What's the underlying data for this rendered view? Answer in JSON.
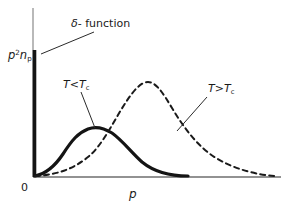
{
  "figure": {
    "type": "physics-distribution-diagram",
    "background": "#ffffff",
    "ink_color": "#1a1a1a",
    "width": 282,
    "height": 209
  },
  "axes": {
    "origin_label": "0",
    "x_label": "p",
    "y_label_base": "p",
    "y_label_exponent": "2",
    "y_label_second": "n",
    "y_label_subscript": "p",
    "y_label_text": "p²nₚ",
    "x_axis": {
      "x1": 33,
      "y1": 177,
      "x2": 281,
      "y2": 177
    },
    "y_axis": {
      "x1": 33,
      "y1": 8,
      "x2": 33,
      "y2": 177
    }
  },
  "annotations": {
    "delta": {
      "text_symbol": "δ",
      "text_rest": "- function",
      "full": "δ - function",
      "leader": {
        "x1": 41,
        "y1": 54,
        "x2": 94,
        "y2": 32
      }
    },
    "below_tc": {
      "prefix": "T",
      "operator": "<",
      "base": "T",
      "subscript": "c",
      "full": "T < Tᶜ",
      "leader": {
        "x1": 81,
        "y1": 92,
        "x2": 95,
        "y2": 128
      }
    },
    "above_tc": {
      "prefix": "T",
      "operator": ">",
      "base": "T",
      "subscript": "c",
      "full": "T > Tᶜ",
      "leader": {
        "x1": 207,
        "y1": 97,
        "x2": 177,
        "y2": 131
      }
    }
  },
  "chart_data": {
    "type": "line",
    "title": "",
    "xlabel": "p",
    "ylabel": "p²nₚ",
    "grid": false,
    "legend": "inline-annotations",
    "xlim": [
      0,
      1
    ],
    "ylim": [
      0,
      1
    ],
    "series": [
      {
        "name": "delta-function condensate spike",
        "style": "thick-vertical-bar",
        "stroke": "#141414",
        "stroke_width": 3.6,
        "x": 0,
        "y_top": 0.78,
        "pixel_path": "M 34.5 50 L 34.5 177"
      },
      {
        "name": "T < Tc",
        "style": "solid",
        "stroke": "#141414",
        "stroke_width": 3.2,
        "peak_x": 0.24,
        "peak_y": 0.3,
        "end_x": 0.62,
        "pixel_path": "M 35 176 C 45 174 55 166 63 154 C 72 140 78 133 88 129 C 96 126 104 128 112 133 C 122 140 131 152 142 162 C 153 171 167 176 188 176"
      },
      {
        "name": "T > Tc",
        "style": "dashed",
        "stroke": "#1a1a1a",
        "stroke_width": 2.0,
        "dash_pattern": "5,4",
        "peak_x": 0.45,
        "peak_y": 0.56,
        "end_x": 0.98,
        "pixel_path": "M 35 176 C 55 175 72 170 88 157 C 103 145 114 120 126 102 C 134 90 141 82 148 82 C 156 82 163 93 172 108 C 184 128 198 147 216 158 C 236 170 258 175 276 176"
      }
    ]
  }
}
